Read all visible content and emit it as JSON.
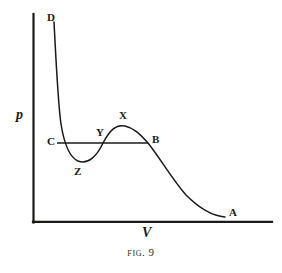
{
  "figure": {
    "caption_prefix": "Fig.",
    "caption_number": "9",
    "ink_color": "#1a1a18",
    "background_color": "#ffffff"
  },
  "axes": {
    "y_label": "p",
    "x_label": "V",
    "origin": [
      33,
      222
    ],
    "y_axis_top": [
      33,
      14
    ],
    "x_axis_right": [
      272,
      222
    ],
    "grid": false
  },
  "points": [
    {
      "id": "D",
      "label": "D",
      "x": 54,
      "y": 22,
      "label_x": 47,
      "label_y": 12
    },
    {
      "id": "C",
      "label": "C",
      "x": 57,
      "y": 143,
      "label_x": 47,
      "label_y": 136
    },
    {
      "id": "Z",
      "label": "Z",
      "x": 78,
      "y": 161,
      "label_x": 74,
      "label_y": 166
    },
    {
      "id": "Y",
      "label": "Y",
      "x": 103,
      "y": 143,
      "label_x": 96,
      "label_y": 127
    },
    {
      "id": "X",
      "label": "X",
      "x": 125,
      "y": 126,
      "label_x": 119,
      "label_y": 110
    },
    {
      "id": "B",
      "label": "B",
      "x": 148,
      "y": 143,
      "label_x": 152,
      "label_y": 134
    },
    {
      "id": "A",
      "label": "A",
      "x": 225,
      "y": 217,
      "label_x": 229,
      "label_y": 207
    }
  ],
  "tieline": {
    "name": "maxwell-construction-line",
    "from": [
      57,
      143
    ],
    "to": [
      148,
      143
    ]
  },
  "chart_data": {
    "type": "line",
    "title": "Fig. 9",
    "xlabel": "V",
    "ylabel": "p",
    "grid": false,
    "series": [
      {
        "name": "van-der-waals-isotherm",
        "path": "M 54 22 C 56 60, 58 104, 61 124 C 64 143, 69 157, 78 161 C 88 165, 97 156, 103 143 C 110 130, 116 124, 125 126 C 134 128, 140 134, 148 143 C 160 158, 172 179, 186 195 C 200 209, 213 216, 225 217"
      }
    ]
  }
}
